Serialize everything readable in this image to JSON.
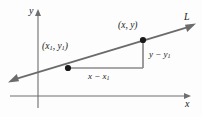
{
  "figure": {
    "type": "coordinate-geometry-diagram",
    "background_color": "#fdfdfd",
    "axes": {
      "x_axis_label": "x",
      "y_axis_label": "y",
      "axis_color": "#6e6e6e",
      "x_axis_y_position": 96,
      "y_axis_x_position": 38
    },
    "line": {
      "label": "L",
      "color": "#6b6b6b",
      "start": [
        12,
        80
      ],
      "end": [
        192,
        26
      ],
      "arrow_start": true,
      "arrow_end": true
    },
    "points": [
      {
        "name": "point-x1y1",
        "label_x": "x",
        "label_x_sub": "1",
        "label_y": "y",
        "label_y_sub": "1",
        "label_open": "(",
        "label_comma": ", ",
        "label_close": ")",
        "cx": 68,
        "cy": 68,
        "color": "#1a1a1a"
      },
      {
        "name": "point-xy",
        "label_x": "x",
        "label_y": "y",
        "label_open": "(",
        "label_comma": ", ",
        "label_close": ")",
        "cx": 143,
        "cy": 40,
        "color": "#1a1a1a"
      }
    ],
    "triangle": {
      "color": "#8a8a8a",
      "horizontal_leg": {
        "x1": 68,
        "y1": 68,
        "x2": 143,
        "y2": 68
      },
      "vertical_leg": {
        "x1": 143,
        "y1": 68,
        "x2": 143,
        "y2": 40
      },
      "run_label": {
        "first": "x",
        "minus": " − ",
        "second": "x",
        "second_sub": "1"
      },
      "rise_label": {
        "first": "y",
        "minus": " − ",
        "second": "y",
        "second_sub": "1"
      }
    }
  }
}
